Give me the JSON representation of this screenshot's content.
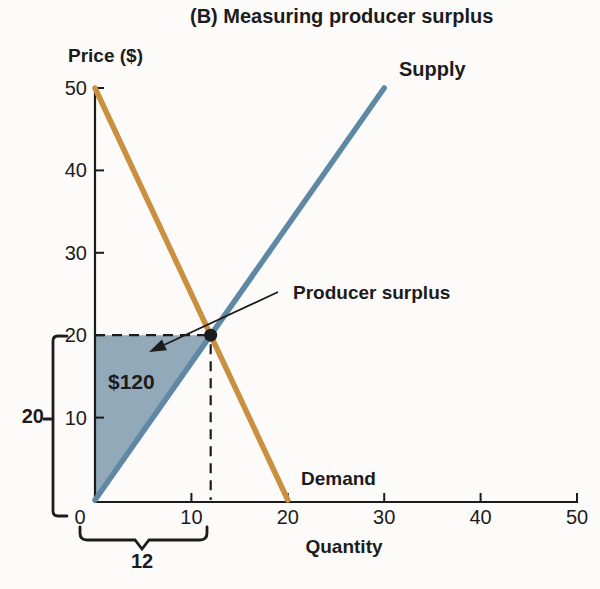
{
  "figure": {
    "title": "(B) Measuring producer surplus"
  },
  "labels": {
    "price": "Price ($)",
    "quantity": "Quantity",
    "supply": "Supply",
    "demand": "Demand",
    "producer_surplus": "Producer surplus",
    "surplus_value": "$120",
    "price_span": "20",
    "quantity_span": "12"
  },
  "colors": {
    "supply_line": "#5f88a4",
    "demand_line": "#ca903f",
    "surplus_fill": "#92a9ba",
    "ink": "#1c1c1c",
    "background": "#fcfbf9"
  },
  "chart_data": {
    "type": "line",
    "title": "(B) Measuring producer surplus",
    "xlabel": "Quantity",
    "ylabel": "Price ($)",
    "xlim": [
      0,
      50
    ],
    "ylim": [
      0,
      50
    ],
    "x_ticks": [
      0,
      10,
      20,
      30,
      40,
      50
    ],
    "y_ticks": [
      10,
      20,
      30,
      40,
      50
    ],
    "grid": false,
    "legend_position": "inline-labels",
    "series": [
      {
        "name": "Supply",
        "color": "#5f88a4",
        "points": [
          [
            0,
            0
          ],
          [
            30,
            50
          ]
        ]
      },
      {
        "name": "Demand",
        "color": "#ca903f",
        "points": [
          [
            0,
            50
          ],
          [
            20,
            0
          ]
        ]
      }
    ],
    "equilibrium": {
      "quantity": 12,
      "price": 20
    },
    "dashed_guides": {
      "price": 20,
      "quantity": 12
    },
    "producer_surplus": {
      "vertices": [
        [
          0,
          0
        ],
        [
          0,
          20
        ],
        [
          12,
          20
        ]
      ],
      "fill": "#92a9ba",
      "area_label": "$120",
      "area_value": 120
    },
    "annotations": [
      {
        "text": "Producer surplus",
        "points_to": "equilibrium-region"
      }
    ],
    "brackets": {
      "price_span_label": "20",
      "quantity_span_label": "12"
    }
  }
}
